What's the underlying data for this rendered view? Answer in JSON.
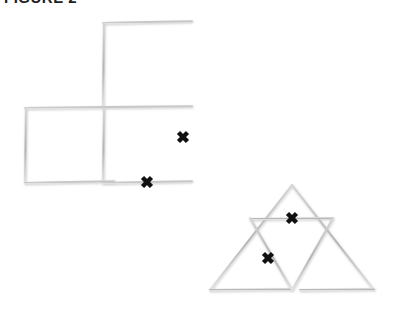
{
  "page": {
    "background_color": "#ffffff",
    "width": 404,
    "height": 320
  },
  "caption": {
    "text": "FIGURE 2",
    "note": "clipped at top edge of image",
    "color": "#1d1d1d"
  },
  "style": {
    "stick_color": "#c4c4c4",
    "stick_color_dark": "#a8a8a8",
    "xmark_color": "#111111",
    "stick_width": 2.0,
    "xmark_width": 4.5
  },
  "figures": [
    {
      "name": "squares-figure",
      "label": "three-square arrangement",
      "square_count": 3,
      "squares": [
        {
          "name": "top-square",
          "x": 103,
          "y": 22,
          "w": 89,
          "h": 85
        },
        {
          "name": "bottom-left-square",
          "x": 25,
          "y": 107,
          "w": 89,
          "h": 76
        },
        {
          "name": "bottom-right-square",
          "x": 103,
          "y": 107,
          "w": 89,
          "h": 76
        }
      ],
      "sticks": [
        {
          "name": "top-square-top-edge",
          "x1": 103,
          "y1": 23,
          "x2": 192,
          "y2": 21
        },
        {
          "name": "top-square-left-edge",
          "x1": 104,
          "y1": 23,
          "x2": 103,
          "y2": 107
        },
        {
          "name": "top-square-right-edge",
          "x1": 192,
          "y1": 22,
          "x2": 192,
          "y2": 107
        },
        {
          "name": "middle-horizontal-edge",
          "x1": 25,
          "y1": 108,
          "x2": 192,
          "y2": 106
        },
        {
          "name": "bottom-left-square-left-edge",
          "x1": 26,
          "y1": 108,
          "x2": 25,
          "y2": 183
        },
        {
          "name": "center-vertical-edge",
          "x1": 104,
          "y1": 108,
          "x2": 103,
          "y2": 183
        },
        {
          "name": "bottom-right-edge",
          "x1": 192,
          "y1": 107,
          "x2": 192,
          "y2": 183
        },
        {
          "name": "bottom-edge-left",
          "x1": 25,
          "y1": 183,
          "x2": 114,
          "y2": 181
        },
        {
          "name": "bottom-edge-right",
          "x1": 103,
          "y1": 183,
          "x2": 192,
          "y2": 181
        }
      ],
      "xmarks": [
        {
          "name": "square-xmark-right",
          "x": 183,
          "y": 137,
          "size": 9
        },
        {
          "name": "square-xmark-bottom",
          "x": 147,
          "y": 182,
          "size": 9
        }
      ]
    },
    {
      "name": "triangle-figure",
      "label": "subdivided triangle arrangement",
      "triangle_count": 4,
      "outer": {
        "apex_x": 292,
        "apex_y": 185,
        "left_x": 210,
        "left_y": 290,
        "right_x": 374,
        "right_y": 290
      },
      "sticks": [
        {
          "name": "outer-left-edge",
          "x1": 292,
          "y1": 185,
          "x2": 210,
          "y2": 290
        },
        {
          "name": "outer-right-edge",
          "x1": 292,
          "y1": 185,
          "x2": 374,
          "y2": 290
        },
        {
          "name": "base-edge-left",
          "x1": 210,
          "y1": 290,
          "x2": 292,
          "y2": 289
        },
        {
          "name": "base-edge-right",
          "x1": 300,
          "y1": 290,
          "x2": 374,
          "y2": 289
        },
        {
          "name": "midline-horizontal",
          "x1": 250,
          "y1": 219,
          "x2": 333,
          "y2": 218
        },
        {
          "name": "midline-left-diagonal",
          "x1": 250,
          "y1": 218,
          "x2": 292,
          "y2": 290
        },
        {
          "name": "midline-right-diagonal",
          "x1": 333,
          "y1": 218,
          "x2": 292,
          "y2": 290
        }
      ],
      "xmarks": [
        {
          "name": "triangle-xmark-upper",
          "x": 292,
          "y": 218,
          "size": 9
        },
        {
          "name": "triangle-xmark-lower",
          "x": 268,
          "y": 258,
          "size": 9
        }
      ]
    }
  ]
}
